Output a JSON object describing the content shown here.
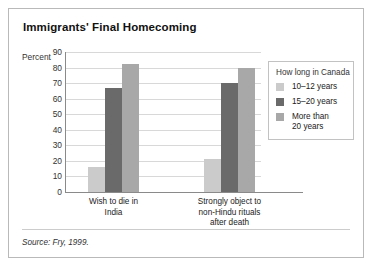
{
  "chart_data": {
    "type": "bar",
    "title": "Immigrants' Final Homecoming",
    "ylabel": "Percent",
    "xlabel": "",
    "ylim": [
      0,
      90
    ],
    "ytick_step": 10,
    "yticks": [
      90,
      80,
      70,
      60,
      50,
      40,
      30,
      20,
      10,
      0
    ],
    "grid": true,
    "legend_position": "right",
    "legend_title": "How long in Canada",
    "categories": [
      "Wish to die in India",
      "Strongly object to non-Hindu rituals after death"
    ],
    "category_lines": [
      [
        "Wish to die in",
        "India"
      ],
      [
        "Strongly object to",
        "non-Hindu rituals",
        "after death"
      ]
    ],
    "series": [
      {
        "name": "10–12 years",
        "label_lines": [
          "10–12 years"
        ],
        "color": "#cbcbcb",
        "values": [
          16,
          21
        ]
      },
      {
        "name": "15–20 years",
        "label_lines": [
          "15–20 years"
        ],
        "color": "#6a6a6a",
        "values": [
          67,
          70
        ]
      },
      {
        "name": "More than 20 years",
        "label_lines": [
          "More than",
          "20 years"
        ],
        "color": "#a8a8a8",
        "values": [
          82,
          80
        ]
      }
    ],
    "source": "Source: Fry, 1999."
  },
  "colors": {
    "frame_border": "#b9b9b9",
    "axis": "#8a8a8a",
    "gridline": "#d8d8d8",
    "text": "#222222"
  }
}
